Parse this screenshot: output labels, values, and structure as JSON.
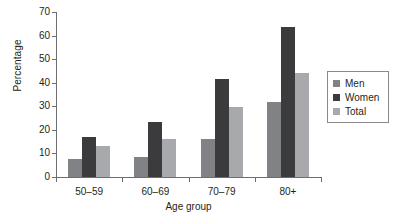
{
  "chart_data": {
    "type": "bar",
    "title": "",
    "xlabel": "Age group",
    "ylabel": "Percentage",
    "categories": [
      "50–59",
      "60–69",
      "70–79",
      "80+"
    ],
    "series": [
      {
        "name": "Men",
        "values": [
          7.5,
          8.5,
          16.0,
          32.0
        ],
        "color": "#808285"
      },
      {
        "name": "Women",
        "values": [
          17.0,
          23.5,
          41.5,
          63.5
        ],
        "color": "#3b3b3d"
      },
      {
        "name": "Total",
        "values": [
          13.0,
          16.0,
          29.5,
          44.0
        ],
        "color": "#a7a9ac"
      }
    ],
    "ylim": [
      0,
      70
    ],
    "yticks": [
      0,
      10,
      20,
      30,
      40,
      50,
      60,
      70
    ],
    "ytick_labels": [
      "0",
      "10",
      "20",
      "30",
      "40",
      "50",
      "60",
      "70"
    ],
    "grid": false,
    "legend_position": "right",
    "legend_entries": [
      "Men",
      "Women",
      "Total"
    ]
  },
  "axis": {
    "y_title": "Percentage",
    "x_title": "Age group"
  }
}
